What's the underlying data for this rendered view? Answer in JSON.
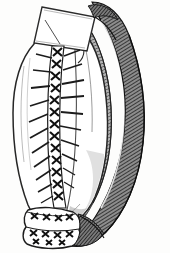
{
  "figure": {
    "domain_note": "monochrome line engraving",
    "width": 170,
    "height": 253,
    "background_color": "#fdfdfc",
    "ink_color": "#1a1a1a",
    "mid_tone_color": "#555555",
    "light_tone_color": "#9a9a9a"
  },
  "parts": {
    "clamp": {
      "name": "surgical clamp",
      "fill": "#ffffff",
      "stroke": "#2b2b2b",
      "corners": "42,7 94,17 86,50 34,44"
    },
    "organ_body": {
      "name": "organ body",
      "fill": "#ffffff",
      "stroke": "#2a2a2a"
    },
    "suture_line": {
      "name": "vertical cross-stitch suture line",
      "stitch_glyph": "X",
      "stitch_count": 13,
      "band_fill": "#ffffff",
      "stitch_color": "#111111",
      "thread_color": "#1b1b1b",
      "threads_per_side": 11
    },
    "bottom_cuff": {
      "name": "stitched cuff",
      "stitch_rows": 3,
      "stitches_per_row": 6,
      "fill": "#ffffff",
      "stroke": "#1d1d1d"
    },
    "dark_band": {
      "name": "hatched omental band",
      "tone": "#4a4a4a",
      "hatch_color": "#242424",
      "hatch_spacing_px": 2
    },
    "inner_band": {
      "name": "inner hatched fold",
      "tone": "#6b6b6b"
    }
  },
  "labels": {
    "caption": "",
    "figure_number": ""
  }
}
